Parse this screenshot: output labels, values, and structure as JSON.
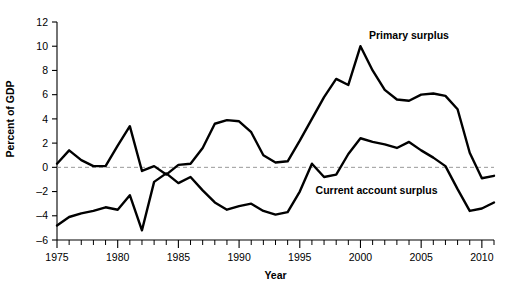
{
  "chart_data": {
    "type": "line",
    "title": "",
    "xlabel": "Year",
    "ylabel": "Percent of GDP",
    "xlim": [
      1975,
      2011
    ],
    "ylim": [
      -6,
      12
    ],
    "ytick_values": [
      -6,
      -4,
      -2,
      0,
      2,
      4,
      6,
      8,
      10,
      12
    ],
    "ytick_labels": [
      "–6",
      "–4",
      "–2",
      "0",
      "2",
      "4",
      "6",
      "8",
      "10",
      "12"
    ],
    "xtick_values": [
      1975,
      1980,
      1985,
      1990,
      1995,
      2000,
      2005,
      2010
    ],
    "xtick_labels": [
      "1975",
      "1980",
      "1985",
      "1990",
      "1995",
      "2000",
      "2005",
      "2010"
    ],
    "xtick_minor_step": 1,
    "grid": false,
    "zero_reference_line": true,
    "legend_position": "inline-annotations",
    "x": [
      1975,
      1976,
      1977,
      1978,
      1979,
      1980,
      1981,
      1982,
      1983,
      1984,
      1985,
      1986,
      1987,
      1988,
      1989,
      1990,
      1991,
      1992,
      1993,
      1994,
      1995,
      1996,
      1997,
      1998,
      1999,
      2000,
      2001,
      2002,
      2003,
      2004,
      2005,
      2006,
      2007,
      2008,
      2009,
      2010,
      2011
    ],
    "series": [
      {
        "name": "Primary surplus",
        "label_x": 2000.7,
        "label_y": 10.6,
        "values": [
          0.3,
          1.4,
          0.6,
          0.1,
          0.1,
          1.8,
          3.4,
          -0.3,
          0.1,
          -0.6,
          0.2,
          0.3,
          1.6,
          3.6,
          3.9,
          3.8,
          2.9,
          1.0,
          0.4,
          0.5,
          2.2,
          4.0,
          5.8,
          7.3,
          6.8,
          10.0,
          8.0,
          6.4,
          5.6,
          5.5,
          6.0,
          6.1,
          5.9,
          4.8,
          1.2,
          -0.9,
          -0.7
        ]
      },
      {
        "name": "Current account surplus",
        "label_x": 1996.3,
        "label_y": -2.2,
        "values": [
          -4.8,
          -4.1,
          -3.8,
          -3.6,
          -3.3,
          -3.5,
          -2.3,
          -5.2,
          -1.2,
          -0.5,
          -1.3,
          -0.8,
          -1.9,
          -2.9,
          -3.5,
          -3.2,
          -3.0,
          -3.6,
          -3.9,
          -3.7,
          -2.0,
          0.3,
          -0.8,
          -0.6,
          1.1,
          2.4,
          2.1,
          1.9,
          1.6,
          2.1,
          1.4,
          0.8,
          0.1,
          -1.8,
          -3.6,
          -3.4,
          -2.9
        ]
      }
    ]
  }
}
